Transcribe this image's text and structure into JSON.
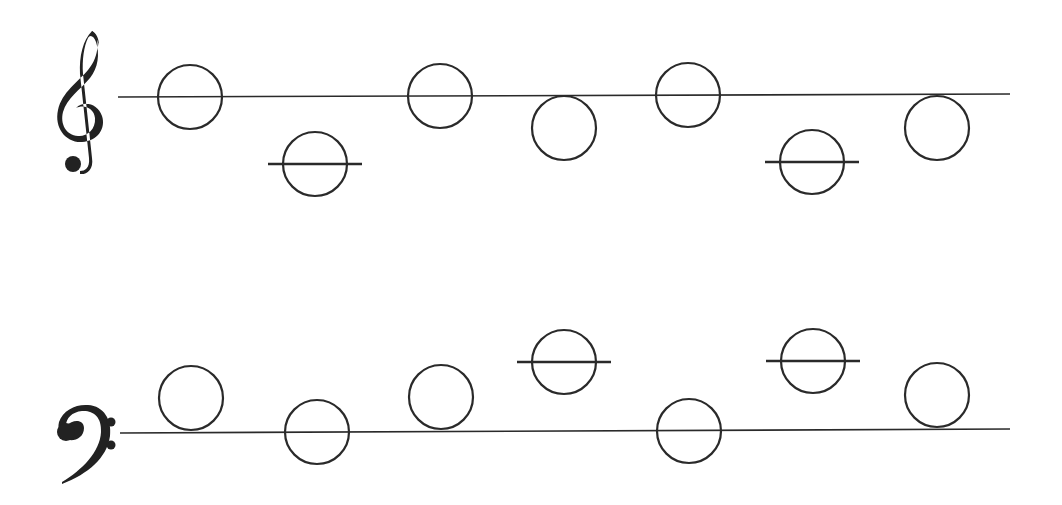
{
  "colors": {
    "ink": "#2a2a2a",
    "background": "#ffffff"
  },
  "staves": [
    {
      "id": "treble",
      "clef": "treble-clef-icon",
      "line": {
        "x1": 118,
        "y1": 97,
        "x2": 1010,
        "y2": 94
      },
      "notes": [
        {
          "cx": 190,
          "cy": 97,
          "ledger": false
        },
        {
          "cx": 315,
          "cy": 164,
          "ledger": true
        },
        {
          "cx": 440,
          "cy": 96,
          "ledger": false
        },
        {
          "cx": 564,
          "cy": 128,
          "ledger": false
        },
        {
          "cx": 688,
          "cy": 95,
          "ledger": false
        },
        {
          "cx": 812,
          "cy": 162,
          "ledger": true
        },
        {
          "cx": 937,
          "cy": 128,
          "ledger": false
        }
      ]
    },
    {
      "id": "bass",
      "clef": "bass-clef-icon",
      "line": {
        "x1": 120,
        "y1": 433,
        "x2": 1010,
        "y2": 429
      },
      "notes": [
        {
          "cx": 191,
          "cy": 398,
          "ledger": false
        },
        {
          "cx": 317,
          "cy": 432,
          "ledger": false
        },
        {
          "cx": 441,
          "cy": 397,
          "ledger": false
        },
        {
          "cx": 564,
          "cy": 362,
          "ledger": true
        },
        {
          "cx": 689,
          "cy": 431,
          "ledger": false
        },
        {
          "cx": 813,
          "cy": 361,
          "ledger": true
        },
        {
          "cx": 937,
          "cy": 395,
          "ledger": false
        }
      ]
    }
  ],
  "note_radius": 32,
  "ledger_half_width": 47
}
